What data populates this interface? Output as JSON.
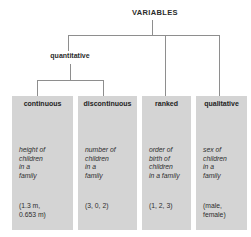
{
  "diagram": {
    "type": "tree",
    "root": {
      "label": "VARIABLES"
    },
    "mid": {
      "label": "quantitative"
    },
    "colors": {
      "box_fill": "#d4d4d4",
      "connector": "#8e8e8e",
      "text": "#2b2b2b",
      "background": "#ffffff"
    },
    "leaves": [
      {
        "label": "continuous",
        "description": "height of\nchildren\nin a\nfamily",
        "example": "(1.3 m,\n0.653 m)",
        "parent": "quantitative"
      },
      {
        "label": "discontinuous",
        "description": "number of\nchildren\nin a\nfamily",
        "example": "(3, 0, 2)",
        "parent": "quantitative"
      },
      {
        "label": "ranked",
        "description": "order of\nbirth of\nchildren\nin a family",
        "example": "(1, 2, 3)",
        "parent": "VARIABLES"
      },
      {
        "label": "qualitative",
        "description": "sex of\nchildren\nin a\nfamily",
        "example": "(male,\nfemale)",
        "parent": "VARIABLES"
      }
    ]
  }
}
